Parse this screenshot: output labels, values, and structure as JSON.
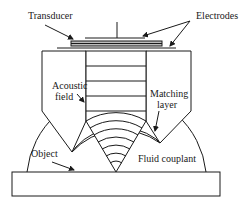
{
  "diagram": {
    "type": "schematic",
    "labels": {
      "transducer": "Transducer",
      "electrodes": "Electrodes",
      "acoustic_field_line1": "Acoustic",
      "acoustic_field_line2": "field",
      "matching_line1": "Matching",
      "matching_line2": "layer",
      "object": "Object",
      "fluid_couplant": "Fluid couplant"
    },
    "colors": {
      "line": "#1a1a1a",
      "background": "#ffffff",
      "transducer_fill": "#bdbdbd"
    }
  }
}
